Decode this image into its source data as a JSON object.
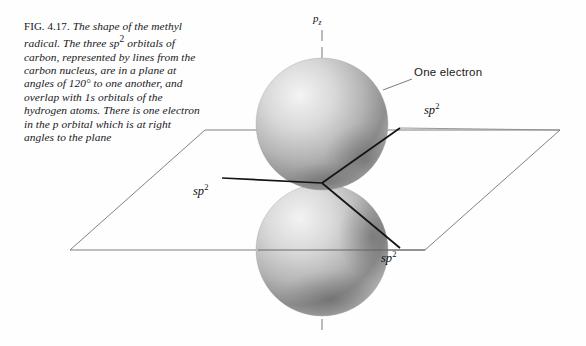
{
  "figure": {
    "number": "FIG. 4.17.",
    "caption_parts": {
      "p1": "The shape of the methyl radical. The three sp",
      "sup1": "2",
      "p2": " orbitals of carbon, represented by lines from the carbon nucleus, are in a plane at angles of 120",
      "deg": "°",
      "p3": " to one another, and overlap with 1s orbitals of the hydrogen atoms. There is one electron in the p orbital which is at right angles to the plane",
      "caption_full": "FIG. 4.17. The shape of the methyl radical. The three sp2 orbitals of carbon, represented by lines from the carbon nucleus, are in a plane at angles of 120° to one another, and overlap with 1s orbitals of the hydrogen atoms. There is one electron in the p orbital which is at right angles to the plane"
    }
  },
  "labels": {
    "axis": {
      "base": "p",
      "sub": "z"
    },
    "electron": "One electron",
    "orbital": {
      "base": "sp",
      "sup": "2"
    },
    "orbital_right_upper": {
      "base": "sp",
      "sup": "2"
    },
    "orbital_left": {
      "base": "sp",
      "sup": "2"
    },
    "orbital_right_lower": {
      "base": "sp",
      "sup": "2"
    }
  },
  "colors": {
    "background": "#fefefe",
    "text": "#17171a",
    "plane_line": "#6e6e72",
    "bond_line": "#141418",
    "axis_line": "#7a7a7e",
    "sphere_light": "#f2f2f2",
    "sphere_mid": "#b8b8b8",
    "sphere_dark": "#6b6b6b"
  },
  "geometry": {
    "plane": {
      "type": "parallelogram",
      "points": [
        [
          205,
          130
        ],
        [
          560,
          130
        ],
        [
          425,
          250
        ],
        [
          70,
          250
        ]
      ]
    },
    "nucleus": [
      322,
      183
    ],
    "p_axis": {
      "x": 322,
      "y_top": 30,
      "y_bottom": 335,
      "style": "dashed"
    },
    "spheres": [
      {
        "name": "upper-lobe",
        "cx": 322,
        "cy": 124,
        "r": 66
      },
      {
        "name": "lower-lobe",
        "cx": 322,
        "cy": 250,
        "r": 66
      }
    ],
    "bonds": [
      {
        "name": "sp2-left",
        "from": [
          322,
          183
        ],
        "to": [
          222,
          178
        ]
      },
      {
        "name": "sp2-upper-right",
        "from": [
          322,
          183
        ],
        "to": [
          400,
          128
        ]
      },
      {
        "name": "sp2-lower-right",
        "from": [
          322,
          183
        ],
        "to": [
          400,
          248
        ]
      }
    ],
    "leader": {
      "name": "one-electron-leader",
      "from": [
        383,
        90
      ],
      "to": [
        412,
        80
      ]
    }
  }
}
